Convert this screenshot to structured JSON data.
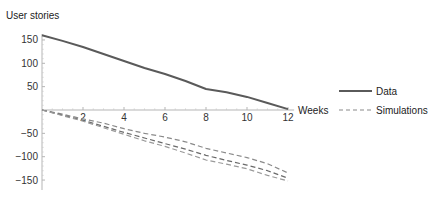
{
  "chart_data": {
    "type": "line",
    "title": "",
    "xlabel": "Weeks",
    "ylabel": "User stories",
    "x": [
      0,
      1,
      2,
      3,
      4,
      5,
      6,
      7,
      8,
      9,
      10,
      11,
      12
    ],
    "xticks": [
      2,
      4,
      6,
      8,
      10,
      12
    ],
    "yticks": [
      150,
      100,
      50,
      -50,
      -100,
      -150
    ],
    "xlim": [
      0,
      12
    ],
    "ylim": [
      -160,
      165
    ],
    "grid": false,
    "legend_position": "right",
    "series": [
      {
        "name": "Data",
        "style": "solid",
        "color": "#5a5a5a",
        "values": [
          160,
          148,
          135,
          120,
          105,
          90,
          77,
          62,
          45,
          38,
          28,
          15,
          2
        ]
      },
      {
        "name": "Simulations",
        "style": "dashed",
        "color": "#8a8a8a",
        "values": [
          0,
          -9,
          -19,
          -28,
          -40,
          -50,
          -58,
          -68,
          -82,
          -92,
          -102,
          -115,
          -135
        ]
      },
      {
        "name": "Simulations",
        "style": "dashed",
        "color": "#6a6a6a",
        "values": [
          0,
          -11,
          -22,
          -35,
          -48,
          -60,
          -72,
          -84,
          -97,
          -108,
          -118,
          -130,
          -146
        ]
      },
      {
        "name": "Simulations",
        "style": "dashed",
        "color": "#9a9a9a",
        "values": [
          0,
          -12,
          -24,
          -38,
          -52,
          -66,
          -78,
          -92,
          -107,
          -116,
          -126,
          -140,
          -152
        ]
      }
    ],
    "legend": [
      {
        "label": "Data",
        "style": "solid"
      },
      {
        "label": "Simulations",
        "style": "dashed"
      }
    ]
  },
  "axes": {
    "y_title": "User stories",
    "x_title": "Weeks"
  },
  "legend": {
    "data_label": "Data",
    "sim_label": "Simulations"
  }
}
